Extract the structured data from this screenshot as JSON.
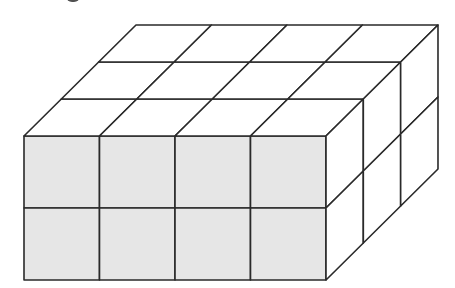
{
  "figure": {
    "dimensions": {
      "length": 4,
      "height": 2,
      "depth": 3
    },
    "total_cubes": 24,
    "colors": {
      "front_face_fill": "#e6e6e6",
      "top_face_fill": "#ffffff",
      "side_face_fill": "#ffffff",
      "edge_stroke": "#2a2a2a",
      "background": "#ffffff"
    },
    "geometry": {
      "front_left": 24,
      "front_top": 136,
      "cell_w": 75.5,
      "cell_h": 72,
      "depth_dx": 37.33,
      "depth_dy": -37
    }
  }
}
